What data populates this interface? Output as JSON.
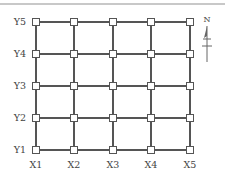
{
  "diagram": {
    "type": "structural-grid-plan",
    "x_axes": [
      {
        "label": "X1",
        "pos": 36
      },
      {
        "label": "X2",
        "pos": 74
      },
      {
        "label": "X3",
        "pos": 113
      },
      {
        "label": "X4",
        "pos": 151
      },
      {
        "label": "X5",
        "pos": 190
      }
    ],
    "y_axes": [
      {
        "label": "Y5",
        "pos": 22
      },
      {
        "label": "Y4",
        "pos": 54
      },
      {
        "label": "Y3",
        "pos": 86
      },
      {
        "label": "Y2",
        "pos": 118
      },
      {
        "label": "Y1",
        "pos": 150
      }
    ],
    "north_arrow": {
      "label": "N"
    },
    "colors": {
      "line": "#555555",
      "node_fill": "#ffffff",
      "text": "#444444",
      "top_rule": "#c8c8c8"
    }
  }
}
